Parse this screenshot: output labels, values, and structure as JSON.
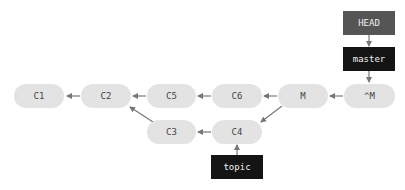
{
  "diagram": {
    "type": "git-commit-graph",
    "colors": {
      "commit_fill": "#e3e3e3",
      "commit_text": "#444444",
      "head_fill": "#555555",
      "branch_fill": "#141414",
      "ref_text": "#f2f2f2",
      "arrow": "#777777"
    },
    "commits": [
      {
        "id": "C1",
        "label": "C1",
        "x": 14,
        "y": 84,
        "w": 50
      },
      {
        "id": "C2",
        "label": "C2",
        "x": 81,
        "y": 84,
        "w": 50
      },
      {
        "id": "C5",
        "label": "C5",
        "x": 147,
        "y": 84,
        "w": 49
      },
      {
        "id": "C6",
        "label": "C6",
        "x": 212,
        "y": 84,
        "w": 50
      },
      {
        "id": "M",
        "label": "M",
        "x": 278,
        "y": 84,
        "w": 50
      },
      {
        "id": "^M",
        "label": "^M",
        "x": 344,
        "y": 84,
        "w": 51
      },
      {
        "id": "C3",
        "label": "C3",
        "x": 147,
        "y": 120,
        "w": 49
      },
      {
        "id": "C4",
        "label": "C4",
        "x": 212,
        "y": 120,
        "w": 50
      }
    ],
    "refs": [
      {
        "id": "HEAD",
        "label": "HEAD",
        "x": 343,
        "y": 11,
        "w": 52,
        "kind": "head"
      },
      {
        "id": "master",
        "label": "master",
        "x": 343,
        "y": 47,
        "w": 52,
        "kind": "branch"
      },
      {
        "id": "topic",
        "label": "topic",
        "x": 211,
        "y": 155,
        "w": 52,
        "kind": "branch"
      }
    ],
    "edges": [
      {
        "from": "C2",
        "to": "C1"
      },
      {
        "from": "C5",
        "to": "C2"
      },
      {
        "from": "C6",
        "to": "C5"
      },
      {
        "from": "M",
        "to": "C6"
      },
      {
        "from": "^M",
        "to": "M"
      },
      {
        "from": "C3",
        "to": "C2"
      },
      {
        "from": "C4",
        "to": "C3"
      },
      {
        "from": "M",
        "to": "C4"
      },
      {
        "from": "HEAD",
        "to": "master"
      },
      {
        "from": "master",
        "to": "^M"
      },
      {
        "from": "topic",
        "to": "C4"
      }
    ]
  }
}
